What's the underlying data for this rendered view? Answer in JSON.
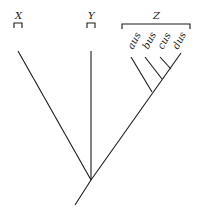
{
  "diagram": {
    "type": "cladogram",
    "groups": [
      {
        "label": "X"
      },
      {
        "label": "Y"
      },
      {
        "label": "Z",
        "members": [
          "aus",
          "bus",
          "cus",
          "dus"
        ]
      }
    ],
    "colors": {
      "line": "#1a1a1a",
      "background": "#ffffff"
    }
  }
}
